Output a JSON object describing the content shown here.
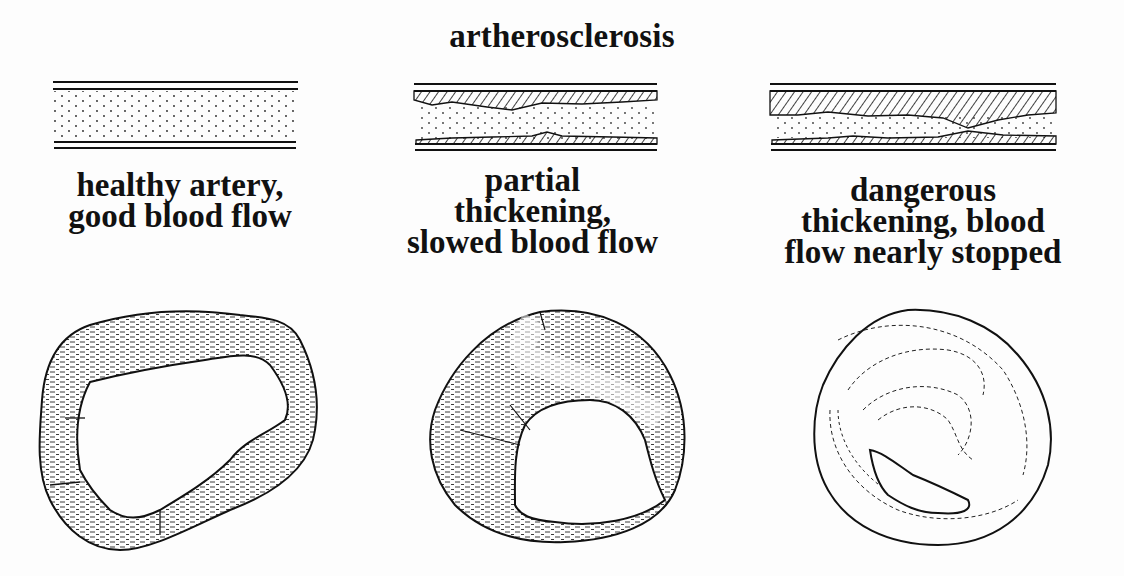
{
  "title": "artherosclerosis",
  "stages": [
    {
      "id": "healthy",
      "label_lines": [
        "healthy artery,",
        "good blood flow"
      ],
      "plaque_level": "none"
    },
    {
      "id": "partial",
      "label_lines": [
        "partial",
        "thickening,",
        "slowed blood flow"
      ],
      "plaque_level": "partial"
    },
    {
      "id": "dangerous",
      "label_lines": [
        "dangerous",
        "thickening, blood",
        "flow nearly stopped"
      ],
      "plaque_level": "severe"
    }
  ],
  "colors": {
    "ink": "#111111",
    "background": "#fdfdfd"
  }
}
